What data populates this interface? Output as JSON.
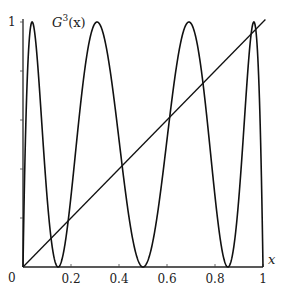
{
  "chart_data": {
    "type": "line",
    "title": "",
    "function_label": "G^3(x)",
    "function_label_parts": {
      "base": "G",
      "sup": "3",
      "arg": "(x)"
    },
    "xlabel": "x",
    "ylabel": "",
    "xlim": [
      0,
      1
    ],
    "ylim": [
      0,
      1
    ],
    "grid": false,
    "x_ticks": [
      0.2,
      0.4,
      0.6,
      0.8,
      1
    ],
    "x_tick_labels": [
      "0.2",
      "0.4",
      "0.6",
      "0.8",
      "1"
    ],
    "y_ticks": [
      0.2,
      0.4,
      0.6,
      0.8,
      1
    ],
    "y_tick_labels": [
      "1"
    ],
    "origin_label": "0",
    "series": [
      {
        "name": "G^3(x)",
        "definition": "third iterate of G(x)=4x(1-x)",
        "samples": 600,
        "maxima_x": [
          0.04,
          0.31,
          0.69,
          0.96
        ],
        "minima_x": [
          0,
          0.15,
          0.5,
          0.85,
          1
        ]
      },
      {
        "name": "y = x",
        "definition": "identity line",
        "x": [
          0,
          1.01
        ],
        "y": [
          0,
          1.01
        ]
      }
    ]
  }
}
